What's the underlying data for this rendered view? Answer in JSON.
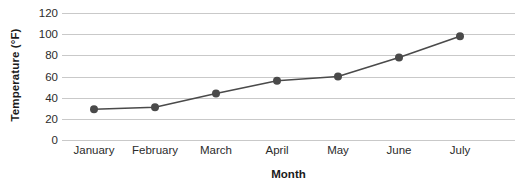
{
  "chart_data": {
    "type": "line",
    "title": "",
    "xlabel": "Month",
    "ylabel": "Temperature (°F)",
    "categories": [
      "January",
      "February",
      "March",
      "April",
      "May",
      "June",
      "July"
    ],
    "values": [
      29,
      31,
      44,
      56,
      60,
      78,
      98
    ],
    "series": [
      {
        "name": "Temperature",
        "values": [
          29,
          31,
          44,
          56,
          60,
          78,
          98
        ]
      }
    ],
    "ylim": [
      0,
      120
    ],
    "yticks": [
      0,
      20,
      40,
      60,
      80,
      100,
      120
    ],
    "ytick_labels": [
      "0",
      "20",
      "40",
      "60",
      "80",
      "100",
      "120"
    ],
    "grid": "horizontal",
    "legend": "none",
    "marker": "circle",
    "colors": {
      "line": "#4a4a4a",
      "marker": "#4a4a4a",
      "gridline": "#c9c9c9",
      "text": "#2b2b2b",
      "title_text": "#1a1a1a",
      "background": "#ffffff"
    }
  }
}
